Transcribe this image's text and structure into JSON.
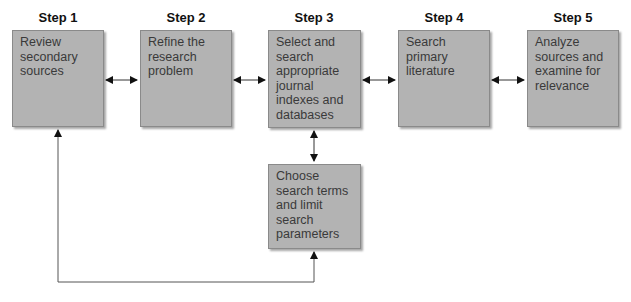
{
  "steps": [
    {
      "label": "Step 1",
      "text": "Review secondary sources"
    },
    {
      "label": "Step 2",
      "text": "Refine the research problem"
    },
    {
      "label": "Step 3",
      "text": "Select and search appropriate journal indexes and databases"
    },
    {
      "label": "Step 4",
      "text": "Search primary literature"
    },
    {
      "label": "Step 5",
      "text": "Analyze sources and examine for relevance"
    }
  ],
  "sub_step": {
    "text": "Choose search terms and limit search parameters"
  },
  "colors": {
    "box_fill": "#b3b3b3",
    "box_border": "#8a8a8a",
    "line": "#222222"
  }
}
